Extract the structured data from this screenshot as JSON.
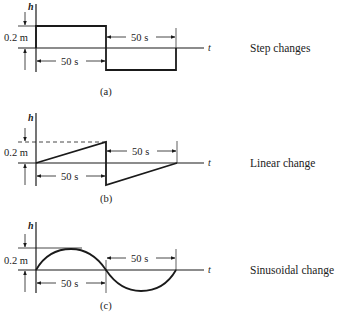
{
  "figure": {
    "panels": [
      {
        "id": "a",
        "caption": "(a)",
        "description": "Step changes",
        "y_axis_label": "h",
        "x_axis_label": "t",
        "amplitude_label": "0.2 m",
        "duration_label_1": "50 s",
        "duration_label_2": "50 s"
      },
      {
        "id": "b",
        "caption": "(b)",
        "description": "Linear change",
        "y_axis_label": "h",
        "x_axis_label": "t",
        "amplitude_label": "0.2 m",
        "duration_label_1": "50 s",
        "duration_label_2": "50 s"
      },
      {
        "id": "c",
        "caption": "(c)",
        "description": "Sinusoidal change",
        "y_axis_label": "h",
        "x_axis_label": "t",
        "amplitude_label": "0.2 m",
        "duration_label_1": "50 s",
        "duration_label_2": "50 s"
      }
    ],
    "colors": {
      "ink": "#1a1a1a",
      "background": "#ffffff"
    }
  }
}
